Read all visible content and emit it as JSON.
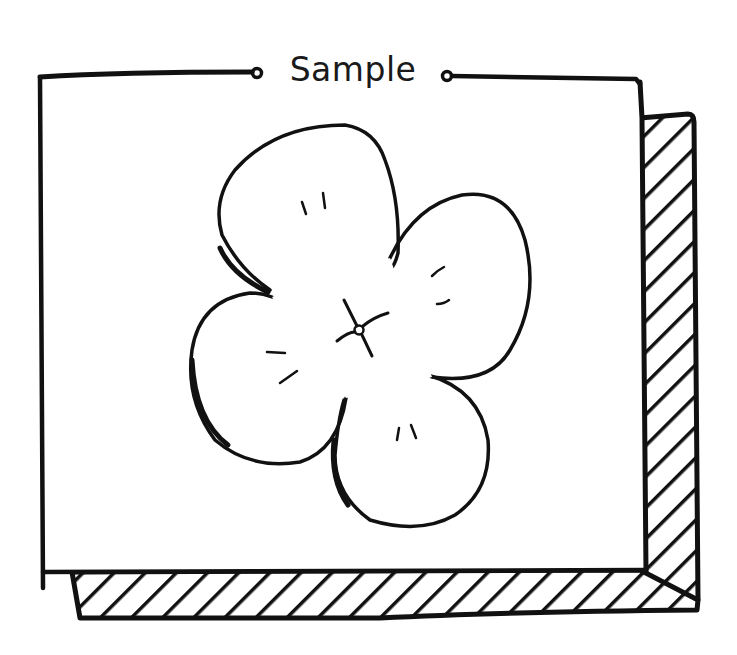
{
  "panel": {
    "title": "Sample",
    "background": "#ffffff",
    "ink_color": "#111111",
    "has_hatched_shadow": true
  },
  "illustration": {
    "subject": "four-petal flower",
    "petal_count": 4,
    "center": "small circle with crossing stamen lines"
  }
}
